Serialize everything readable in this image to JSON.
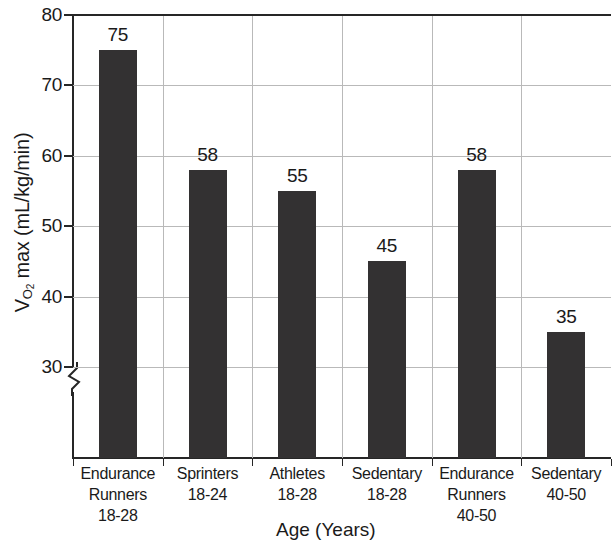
{
  "chart_data": {
    "type": "bar",
    "title": "",
    "xlabel": "Age (Years)",
    "ylabel": "Vo2 max (mL/kg/min)",
    "ylabel_parts": {
      "prefix": "V",
      "sub": "O",
      "sub2": "2",
      "suffix": " max (mL/kg/min)"
    },
    "categories": [
      "Endurance\nRunners\n18-28",
      "Sprinters\n18-24",
      "Athletes\n18-28",
      "Sedentary\n18-28",
      "Endurance\nRunners\n40-50",
      "Sedentary\n40-50"
    ],
    "category_lines": [
      [
        "Endurance",
        "Runners",
        "18-28"
      ],
      [
        "Sprinters",
        "18-24",
        ""
      ],
      [
        "Athletes",
        "18-28",
        ""
      ],
      [
        "Sedentary",
        "18-28",
        ""
      ],
      [
        "Endurance",
        "Runners",
        "40-50"
      ],
      [
        "Sedentary",
        "40-50",
        ""
      ]
    ],
    "values": [
      75,
      58,
      55,
      45,
      58,
      35
    ],
    "value_labels": [
      "75",
      "58",
      "55",
      "45",
      "58",
      "35"
    ],
    "ylim": [
      20,
      80
    ],
    "yticks": [
      80,
      70,
      60,
      50,
      40,
      30
    ],
    "ytick_labels": [
      "80",
      "70",
      "60",
      "50",
      "40",
      "30"
    ],
    "axis_break": true,
    "axis_break_below": 30,
    "grid": true,
    "legend": "none",
    "bar_color": "#333132",
    "grid_color": "#b9b9b9",
    "axis_color": "#262626",
    "background": "#ffffff"
  }
}
